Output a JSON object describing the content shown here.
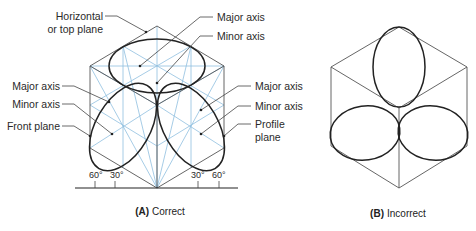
{
  "figure_a": {
    "caption_letter": "(A)",
    "caption_text": "Correct",
    "labels": {
      "horizontal_line1": "Horizontal",
      "horizontal_line2": "or top plane",
      "top_major_axis": "Major axis",
      "top_minor_axis": "Minor axis",
      "left_major_axis": "Major axis",
      "left_minor_axis": "Minor axis",
      "front_plane": "Front plane",
      "right_major_axis": "Major axis",
      "right_minor_axis": "Minor axis",
      "profile_line1": "Profile",
      "profile_line2": "plane"
    },
    "angles": [
      "60°",
      "30°",
      "30°",
      "60°"
    ]
  },
  "figure_b": {
    "caption_letter": "(B)",
    "caption_text": "Incorrect"
  },
  "colors": {
    "construction_blue": "#8fbfe0",
    "ellipse": "#222222",
    "edge": "#555555"
  }
}
